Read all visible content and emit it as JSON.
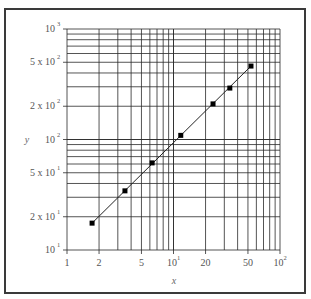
{
  "chart_data": {
    "type": "scatter",
    "scale": {
      "x": "log",
      "y": "log"
    },
    "title": "",
    "xlabel": "x",
    "ylabel": "y",
    "xlim": [
      1,
      100
    ],
    "ylim": [
      10,
      1000
    ],
    "grid": true,
    "grid_minor": true,
    "legend": null,
    "x_ticks": [
      {
        "value": 1,
        "label": "1",
        "sup": ""
      },
      {
        "value": 2,
        "label": "2",
        "sup": ""
      },
      {
        "value": 5,
        "label": "5",
        "sup": ""
      },
      {
        "value": 10,
        "label": "10",
        "sup": "1"
      },
      {
        "value": 20,
        "label": "20",
        "sup": ""
      },
      {
        "value": 50,
        "label": "50",
        "sup": ""
      },
      {
        "value": 100,
        "label": "10",
        "sup": "2"
      }
    ],
    "y_ticks": [
      {
        "value": 10,
        "label": "10",
        "sup": "1"
      },
      {
        "value": 20,
        "label": "2 x 10",
        "sup": "1"
      },
      {
        "value": 50,
        "label": "5 x 10",
        "sup": "1"
      },
      {
        "value": 100,
        "label": "10",
        "sup": "2"
      },
      {
        "value": 200,
        "label": "2 x 10",
        "sup": "2"
      },
      {
        "value": 500,
        "label": "5 x 10",
        "sup": "2"
      },
      {
        "value": 1000,
        "label": "10",
        "sup": "3"
      }
    ],
    "series": [
      {
        "name": "data",
        "marker": "square",
        "line": "fit",
        "x": [
          1.72,
          3.5,
          6.3,
          11.7,
          23.5,
          33.8,
          53.4
        ],
        "y": [
          17.5,
          34.3,
          61.4,
          109,
          210,
          292,
          462
        ]
      }
    ]
  },
  "colors": {
    "grid": "#2a2a2a",
    "line": "#222222",
    "marker": "#000000",
    "frame": "#3a3a3a"
  }
}
